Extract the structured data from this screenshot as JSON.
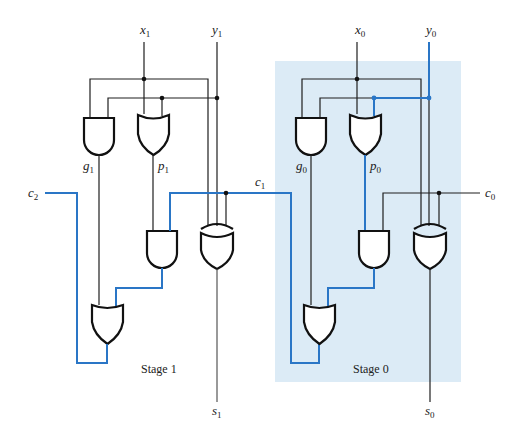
{
  "diagram": {
    "colors": {
      "wire": "#1f1f1f",
      "highlight_wire": "#2a76c6",
      "stage0_shading": "#dcebf6",
      "gate_fill": "#ffffff"
    },
    "inputs": {
      "x1": {
        "base": "x",
        "sub": "1"
      },
      "y1": {
        "base": "y",
        "sub": "1"
      },
      "x0": {
        "base": "x",
        "sub": "0"
      },
      "y0": {
        "base": "y",
        "sub": "0"
      },
      "c0": {
        "base": "c",
        "sub": "0"
      }
    },
    "signals": {
      "g1": {
        "base": "g",
        "sub": "1"
      },
      "p1": {
        "base": "p",
        "sub": "1"
      },
      "g0": {
        "base": "g",
        "sub": "0"
      },
      "p0": {
        "base": "p",
        "sub": "0"
      },
      "c1": {
        "base": "c",
        "sub": "1"
      },
      "c2": {
        "base": "c",
        "sub": "2"
      }
    },
    "outputs": {
      "s1": {
        "base": "s",
        "sub": "1"
      },
      "s0": {
        "base": "s",
        "sub": "0"
      }
    },
    "stages": [
      {
        "label": "Stage 1",
        "gates": [
          "AND g1",
          "OR p1",
          "AND p1·c1",
          "OR c2",
          "XOR s1"
        ]
      },
      {
        "label": "Stage 0",
        "highlighted": true,
        "gates": [
          "AND g0",
          "OR p0",
          "AND p0·c0",
          "OR c1",
          "XOR s0"
        ]
      }
    ]
  }
}
